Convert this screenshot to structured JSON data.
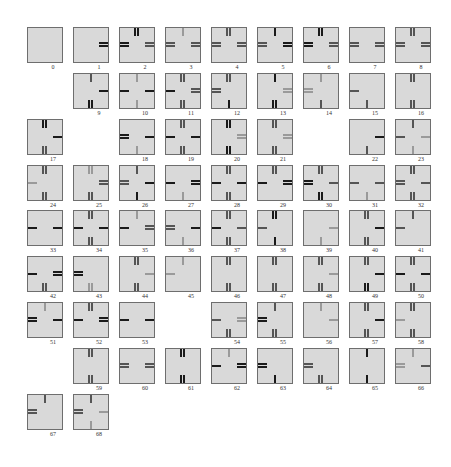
{
  "figure": {
    "colors": {
      "tile_bg": "#d9d9d9",
      "border": "#6e6e6e",
      "dark": "#1a1a1a",
      "mid": "#555555",
      "light": "#9a9a9a"
    },
    "tiles": [
      {
        "id": "0",
        "col": 0,
        "row": 0,
        "t": "",
        "r": "",
        "b": "",
        "l": ""
      },
      {
        "id": "1",
        "col": 1,
        "row": 0,
        "t": "",
        "r": "d2",
        "b": "",
        "l": ""
      },
      {
        "id": "2",
        "col": 2,
        "row": 0,
        "t": "d2",
        "r": "m2",
        "b": "",
        "l": "d2"
      },
      {
        "id": "3",
        "col": 3,
        "row": 0,
        "t": "l1",
        "r": "m2",
        "b": "",
        "l": "m2"
      },
      {
        "id": "4",
        "col": 4,
        "row": 0,
        "t": "m2",
        "r": "m2",
        "b": "",
        "l": "m2"
      },
      {
        "id": "5",
        "col": 5,
        "row": 0,
        "t": "d1",
        "r": "d2",
        "b": "",
        "l": "m2"
      },
      {
        "id": "6",
        "col": 6,
        "row": 0,
        "t": "d2",
        "r": "m2",
        "b": "",
        "l": "d2"
      },
      {
        "id": "7",
        "col": 7,
        "row": 0,
        "t": "",
        "r": "m2",
        "b": "",
        "l": "m2"
      },
      {
        "id": "8",
        "col": 8,
        "row": 0,
        "t": "m2",
        "r": "m2",
        "b": "",
        "l": "m2"
      },
      {
        "id": "9",
        "col": 1,
        "row": 1,
        "t": "m1",
        "r": "d1",
        "b": "d2",
        "l": ""
      },
      {
        "id": "10",
        "col": 2,
        "row": 1,
        "t": "l1",
        "r": "d1",
        "b": "l1",
        "l": "d1"
      },
      {
        "id": "11",
        "col": 3,
        "row": 1,
        "t": "m2",
        "r": "m2",
        "b": "m2",
        "l": "d1"
      },
      {
        "id": "12",
        "col": 4,
        "row": 1,
        "t": "m2",
        "r": "",
        "b": "d1",
        "l": "m2"
      },
      {
        "id": "13",
        "col": 5,
        "row": 1,
        "t": "d1",
        "r": "l2",
        "b": "d2",
        "l": ""
      },
      {
        "id": "14",
        "col": 6,
        "row": 1,
        "t": "l1",
        "r": "",
        "b": "m1",
        "l": "l2"
      },
      {
        "id": "15",
        "col": 7,
        "row": 1,
        "t": "",
        "r": "",
        "b": "m1",
        "l": "m1"
      },
      {
        "id": "16",
        "col": 8,
        "row": 1,
        "t": "m2",
        "r": "",
        "b": "m2",
        "l": ""
      },
      {
        "id": "17",
        "col": 0,
        "row": 2,
        "t": "d2",
        "r": "d1",
        "b": "m2",
        "l": ""
      },
      {
        "id": "18",
        "col": 2,
        "row": 2,
        "t": "",
        "r": "d1",
        "b": "l1",
        "l": "d2"
      },
      {
        "id": "19",
        "col": 3,
        "row": 2,
        "t": "m2",
        "r": "d1",
        "b": "m2",
        "l": "d1"
      },
      {
        "id": "20",
        "col": 4,
        "row": 2,
        "t": "d2",
        "r": "l2",
        "b": "d2",
        "l": ""
      },
      {
        "id": "21",
        "col": 5,
        "row": 2,
        "t": "m2",
        "r": "l2",
        "b": "m2",
        "l": ""
      },
      {
        "id": "22",
        "col": 7,
        "row": 2,
        "t": "",
        "r": "d1",
        "b": "m1",
        "l": ""
      },
      {
        "id": "23",
        "col": 8,
        "row": 2,
        "t": "m1",
        "r": "l1",
        "b": "l1",
        "l": "m1"
      },
      {
        "id": "24",
        "col": 0,
        "row": 3,
        "t": "m2",
        "r": "",
        "b": "m2",
        "l": "l1"
      },
      {
        "id": "25",
        "col": 1,
        "row": 3,
        "t": "l2",
        "r": "m2",
        "b": "m2",
        "l": ""
      },
      {
        "id": "26",
        "col": 2,
        "row": 3,
        "t": "m1",
        "r": "d1",
        "b": "d1",
        "l": "m2"
      },
      {
        "id": "27",
        "col": 3,
        "row": 3,
        "t": "",
        "r": "d2",
        "b": "l1",
        "l": "d1"
      },
      {
        "id": "28",
        "col": 4,
        "row": 3,
        "t": "m2",
        "r": "d1",
        "b": "m2",
        "l": "d1"
      },
      {
        "id": "29",
        "col": 5,
        "row": 3,
        "t": "m2",
        "r": "d2",
        "b": "",
        "l": "d1"
      },
      {
        "id": "30",
        "col": 6,
        "row": 3,
        "t": "m2",
        "r": "m1",
        "b": "d2",
        "l": "d2"
      },
      {
        "id": "31",
        "col": 7,
        "row": 3,
        "t": "",
        "r": "m1",
        "b": "l1",
        "l": "m1"
      },
      {
        "id": "32",
        "col": 8,
        "row": 3,
        "t": "m2",
        "r": "m1",
        "b": "m2",
        "l": "m2"
      },
      {
        "id": "33",
        "col": 0,
        "row": 4,
        "t": "",
        "r": "d1",
        "b": "",
        "l": "d1"
      },
      {
        "id": "34",
        "col": 1,
        "row": 4,
        "t": "m2",
        "r": "d1",
        "b": "m2",
        "l": "d1"
      },
      {
        "id": "35",
        "col": 2,
        "row": 4,
        "t": "l1",
        "r": "m2",
        "b": "",
        "l": "d1"
      },
      {
        "id": "36",
        "col": 3,
        "row": 4,
        "t": "",
        "r": "d1",
        "b": "l1",
        "l": "m2"
      },
      {
        "id": "37",
        "col": 4,
        "row": 4,
        "t": "m2",
        "r": "m1",
        "b": "m2",
        "l": "d1"
      },
      {
        "id": "38",
        "col": 5,
        "row": 4,
        "t": "d2",
        "r": "",
        "b": "d1",
        "l": "m1"
      },
      {
        "id": "39",
        "col": 6,
        "row": 4,
        "t": "",
        "r": "l1",
        "b": "l1",
        "l": ""
      },
      {
        "id": "40",
        "col": 7,
        "row": 4,
        "t": "m2",
        "r": "d1",
        "b": "m2",
        "l": ""
      },
      {
        "id": "41",
        "col": 8,
        "row": 4,
        "t": "m1",
        "r": "",
        "b": "",
        "l": "m1"
      },
      {
        "id": "42",
        "col": 0,
        "row": 5,
        "t": "",
        "r": "d2",
        "b": "m2",
        "l": "d1"
      },
      {
        "id": "43",
        "col": 1,
        "row": 5,
        "t": "",
        "r": "",
        "b": "l2",
        "l": "d2"
      },
      {
        "id": "44",
        "col": 2,
        "row": 5,
        "t": "m2",
        "r": "l1",
        "b": "m2",
        "l": ""
      },
      {
        "id": "45",
        "col": 3,
        "row": 5,
        "t": "l1",
        "r": "",
        "b": "",
        "l": "l1"
      },
      {
        "id": "46",
        "col": 4,
        "row": 5,
        "t": "m2",
        "r": "",
        "b": "m2",
        "l": ""
      },
      {
        "id": "47",
        "col": 5,
        "row": 5,
        "t": "m2",
        "r": "",
        "b": "m2",
        "l": ""
      },
      {
        "id": "48",
        "col": 6,
        "row": 5,
        "t": "m2",
        "r": "l1",
        "b": "m2",
        "l": ""
      },
      {
        "id": "49",
        "col": 7,
        "row": 5,
        "t": "m2",
        "r": "d1",
        "b": "d2",
        "l": ""
      },
      {
        "id": "50",
        "col": 8,
        "row": 5,
        "t": "m2",
        "r": "d1",
        "b": "m2",
        "l": "d1"
      },
      {
        "id": "51",
        "col": 0,
        "row": 6,
        "t": "l1",
        "r": "d1",
        "b": "",
        "l": "d2"
      },
      {
        "id": "52",
        "col": 1,
        "row": 6,
        "t": "m2",
        "r": "d2",
        "b": "",
        "l": "d1"
      },
      {
        "id": "53",
        "col": 2,
        "row": 6,
        "t": "",
        "r": "d1",
        "b": "",
        "l": "d1"
      },
      {
        "id": "54",
        "col": 4,
        "row": 6,
        "t": "",
        "r": "l2",
        "b": "m2",
        "l": "m1"
      },
      {
        "id": "55",
        "col": 5,
        "row": 6,
        "t": "m1",
        "r": "",
        "b": "m2",
        "l": "d2"
      },
      {
        "id": "56",
        "col": 6,
        "row": 6,
        "t": "l1",
        "r": "l1",
        "b": "",
        "l": ""
      },
      {
        "id": "57",
        "col": 7,
        "row": 6,
        "t": "m2",
        "r": "d1",
        "b": "m2",
        "l": ""
      },
      {
        "id": "58",
        "col": 8,
        "row": 6,
        "t": "m2",
        "r": "",
        "b": "m2",
        "l": "l1"
      },
      {
        "id": "59",
        "col": 1,
        "row": 7,
        "t": "m2",
        "r": "",
        "b": "m2",
        "l": ""
      },
      {
        "id": "60",
        "col": 2,
        "row": 7,
        "t": "",
        "r": "m2",
        "b": "",
        "l": "m2"
      },
      {
        "id": "61",
        "col": 3,
        "row": 7,
        "t": "d2",
        "r": "",
        "b": "d2",
        "l": ""
      },
      {
        "id": "62",
        "col": 4,
        "row": 7,
        "t": "l1",
        "r": "d2",
        "b": "",
        "l": "d1"
      },
      {
        "id": "63",
        "col": 5,
        "row": 7,
        "t": "",
        "r": "",
        "b": "d1",
        "l": "d2"
      },
      {
        "id": "64",
        "col": 6,
        "row": 7,
        "t": "",
        "r": "",
        "b": "m2",
        "l": "m2"
      },
      {
        "id": "65",
        "col": 7,
        "row": 7,
        "t": "d1",
        "r": "",
        "b": "d1",
        "l": ""
      },
      {
        "id": "66",
        "col": 8,
        "row": 7,
        "t": "l1",
        "r": "m1",
        "b": "",
        "l": "l2"
      },
      {
        "id": "67",
        "col": 0,
        "row": 8,
        "t": "m1",
        "r": "",
        "b": "",
        "l": "m2"
      },
      {
        "id": "68",
        "col": 1,
        "row": 8,
        "t": "m1",
        "r": "l1",
        "b": "l1",
        "l": "m2"
      }
    ]
  }
}
